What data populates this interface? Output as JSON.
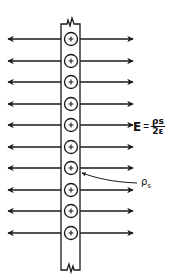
{
  "diagram": {
    "charge_symbol": "+",
    "charge_count": 10,
    "equation": {
      "lhs": "E",
      "equals": "=",
      "numerator": "ρs",
      "denominator": "2ε"
    },
    "label": {
      "symbol": "ρ",
      "subscript": "s"
    },
    "colors": {
      "line": "#1a1a1a",
      "background": "#ffffff"
    }
  }
}
